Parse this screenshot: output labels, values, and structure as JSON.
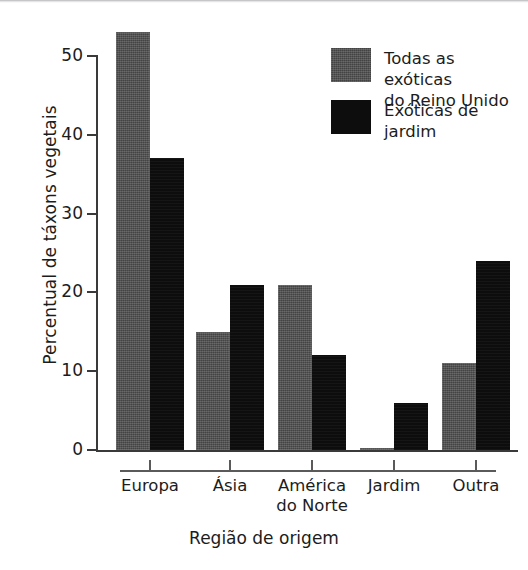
{
  "chart_data": {
    "type": "bar",
    "title": "",
    "xlabel": "Região de origem",
    "ylabel": "Percentual de táxons vegetais",
    "categories": [
      "Europa",
      "Ásia",
      "América do Norte",
      "Jardim",
      "Outra"
    ],
    "category_lines": [
      [
        "Europa"
      ],
      [
        "Ásia"
      ],
      [
        "América",
        "do Norte"
      ],
      [
        "Jardim"
      ],
      [
        "Outra"
      ]
    ],
    "series": [
      {
        "name": "Todas as exóticas do Reino Unido",
        "color": "#4b4b4b",
        "values": [
          53,
          15,
          21,
          0.3,
          11
        ]
      },
      {
        "name": "Exóticas de jardim",
        "color": "#0d0d0d",
        "values": [
          37,
          21,
          12,
          6,
          24
        ]
      }
    ],
    "ylim": [
      0,
      53
    ],
    "yticks": [
      0,
      10,
      20,
      30,
      40,
      50
    ],
    "ytick_labels": [
      "0",
      "10",
      "20",
      "30",
      "40",
      "50"
    ],
    "grid": false,
    "legend_position": "top-right"
  },
  "legend": {
    "entries": [
      {
        "label": "Todas as exóticas\ndo Reino Unido",
        "swatch": "series-0"
      },
      {
        "label": "Exóticas de jardim",
        "swatch": "series-1"
      }
    ]
  },
  "axes": {
    "y_title": "Percentual de táxons vegetais",
    "x_title": "Região de origem"
  }
}
